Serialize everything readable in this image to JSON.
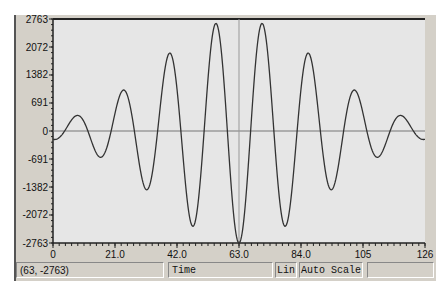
{
  "chart_data": {
    "type": "line",
    "title": "",
    "xlabel": "Time",
    "ylabel": "",
    "xlim": [
      0,
      126
    ],
    "ylim": [
      -2763,
      2763
    ],
    "grid": false,
    "legend": null,
    "x_ticks": [
      "0",
      "21.0",
      "42.0",
      "63.0",
      "84.0",
      "105",
      "126"
    ],
    "y_ticks": [
      "2763",
      "2072",
      "1382",
      "691",
      "0",
      "-691",
      "-1382",
      "-2072",
      "-2763"
    ],
    "cursor": {
      "x": 63,
      "y": -2763
    },
    "model": {
      "form": "y = -A*cos(2*pi*(x-c)/T)*exp(-((x-c)/w)^2)",
      "A": 2763,
      "c": 63,
      "T": 15.75,
      "w": 39.1
    },
    "series": [
      {
        "name": "signal",
        "x": [
          0,
          7.9,
          15.75,
          23.6,
          31.5,
          39.4,
          47.25,
          55.1,
          63,
          70.9,
          78.75,
          86.6,
          94.5,
          102.4,
          110.25,
          118.1,
          126
        ],
        "values": [
          0,
          380,
          -691,
          1100,
          -1450,
          1850,
          -2200,
          2680,
          -2763,
          2680,
          -2200,
          1850,
          -1450,
          1100,
          -691,
          380,
          0
        ]
      }
    ]
  },
  "status": {
    "coords": "(63, -2763)",
    "xaxis_label": "Time",
    "scale_type": "Lin",
    "scale_mode": "Auto Scale",
    "extra": ""
  },
  "colors": {
    "plot_bg": "#e6e6e6",
    "trace": "#333333",
    "axis": "#222222",
    "zero_line": "#777777",
    "cursor_line": "#888888"
  }
}
